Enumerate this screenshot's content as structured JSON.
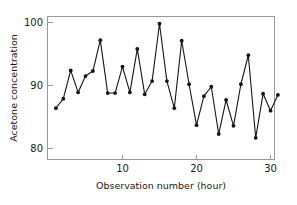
{
  "chart_data": {
    "type": "line",
    "title": "",
    "xlabel": "Observation number (hour)",
    "ylabel": "Acetone concentration",
    "xlim": [
      1,
      31
    ],
    "ylim": [
      78,
      101
    ],
    "xticks": [
      10,
      20,
      30
    ],
    "yticks": [
      80,
      90,
      100
    ],
    "xtick_labels": [
      "10",
      "20",
      "30"
    ],
    "ytick_labels": [
      "80",
      "90",
      "100"
    ],
    "grid": false,
    "legend": false,
    "marker": "filled-circle",
    "line_color": "#151515",
    "marker_color": "#151515",
    "frame_color": "#9a9a9a",
    "x": [
      1,
      2,
      3,
      4,
      5,
      6,
      7,
      8,
      9,
      10,
      11,
      12,
      13,
      14,
      15,
      16,
      17,
      18,
      19,
      20,
      21,
      22,
      23,
      24,
      25,
      26,
      27,
      28,
      29,
      30,
      31
    ],
    "values": [
      86.4,
      87.9,
      92.4,
      88.9,
      91.5,
      92.3,
      97.2,
      88.8,
      88.8,
      93.0,
      88.9,
      95.8,
      88.6,
      90.7,
      99.8,
      90.7,
      86.4,
      97.1,
      90.2,
      83.7,
      88.3,
      89.8,
      82.3,
      87.7,
      83.6,
      90.2,
      94.8,
      81.7,
      88.7,
      86.0,
      88.5
    ],
    "series": [
      {
        "name": "Acetone concentration",
        "values": [
          86.4,
          87.9,
          92.4,
          88.9,
          91.5,
          92.3,
          97.2,
          88.8,
          88.8,
          93.0,
          88.9,
          95.8,
          88.6,
          90.7,
          99.8,
          90.7,
          86.4,
          97.1,
          90.2,
          83.7,
          88.3,
          89.8,
          82.3,
          87.7,
          83.6,
          90.2,
          94.8,
          81.7,
          88.7,
          86.0,
          88.5
        ]
      }
    ]
  },
  "axes": {
    "x_title": "Observation number (hour)",
    "y_title": "Acetone concentration",
    "x_tick_0": "10",
    "x_tick_1": "20",
    "x_tick_2": "30",
    "y_tick_0": "100",
    "y_tick_1": "90",
    "y_tick_2": "80"
  }
}
